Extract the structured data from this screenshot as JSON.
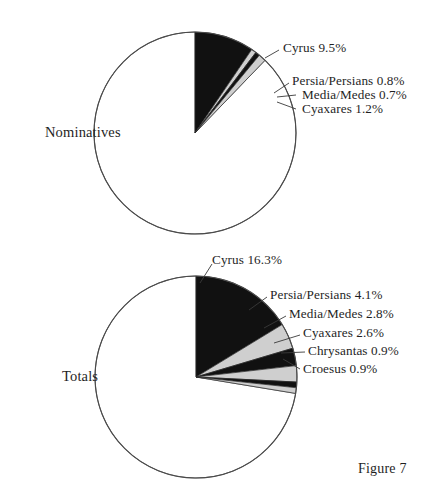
{
  "caption": "Figure 7",
  "charts": [
    {
      "id": "nominatives",
      "side_label": "Nominatives",
      "center": {
        "x": 195,
        "y": 133
      },
      "radius": 101,
      "slices": [
        {
          "name": "Cyrus",
          "value": 9.5,
          "color": "#111111",
          "label": "Cyrus 9.5%",
          "label_x": 283,
          "label_y": 40,
          "leader": [
            [
              279,
              50
            ],
            [
              265,
              58
            ]
          ]
        },
        {
          "name": "Persia/Persians",
          "value": 0.8,
          "color": "#cfcfcf",
          "label": "Persia/Persians 0.8%",
          "label_x": 292,
          "label_y": 73,
          "leader": [
            [
              289,
              83
            ],
            [
              274,
              93
            ]
          ]
        },
        {
          "name": "Media/Medes",
          "value": 0.7,
          "color": "#111111",
          "label": "Media/Medes 0.7%",
          "label_x": 302,
          "label_y": 87,
          "leader": [
            [
              296,
              95
            ],
            [
              277,
              97
            ]
          ]
        },
        {
          "name": "Cyaxares",
          "value": 1.2,
          "color": "#cfcfcf",
          "label": "Cyaxares 1.2%",
          "label_x": 302,
          "label_y": 101,
          "leader": [
            [
              296,
              109
            ],
            [
              277,
              102
            ]
          ]
        }
      ],
      "remainder": {
        "name": "Other",
        "value": 87.8,
        "color": "#ffffff"
      }
    },
    {
      "id": "totals",
      "side_label": "Totals",
      "center": {
        "x": 196,
        "y": 377
      },
      "radius": 101,
      "slices": [
        {
          "name": "Cyrus",
          "value": 16.3,
          "color": "#111111",
          "label": "Cyrus 16.3%",
          "label_x": 212,
          "label_y": 252,
          "leader": [
            [
              212,
              264
            ],
            [
              200,
              283
            ]
          ]
        },
        {
          "name": "Persia/Persians",
          "value": 4.1,
          "color": "#cfcfcf",
          "label": "Persia/Persians 4.1%",
          "label_x": 270,
          "label_y": 287,
          "leader": [
            [
              267,
              297
            ],
            [
              249,
              310
            ]
          ]
        },
        {
          "name": "Media/Medes",
          "value": 2.8,
          "color": "#111111",
          "label": "Media/Medes 2.8%",
          "label_x": 289,
          "label_y": 306,
          "leader": [
            [
              286,
              316
            ],
            [
              264,
              328
            ]
          ]
        },
        {
          "name": "Cyaxares",
          "value": 2.6,
          "color": "#cfcfcf",
          "label": "Cyaxares 2.6%",
          "label_x": 303,
          "label_y": 325,
          "leader": [
            [
              300,
              335
            ],
            [
              274,
              343
            ]
          ]
        },
        {
          "name": "Chrysantas",
          "value": 0.9,
          "color": "#111111",
          "label": "Chrysantas 0.9%",
          "label_x": 308,
          "label_y": 343,
          "leader": [
            [
              305,
              352
            ],
            [
              281,
              353
            ]
          ]
        },
        {
          "name": "Croesus",
          "value": 0.9,
          "color": "#cfcfcf",
          "label": "Croesus 0.9%",
          "label_x": 303,
          "label_y": 361,
          "leader": [
            [
              300,
              369
            ],
            [
              283,
              359
            ]
          ]
        }
      ],
      "remainder": {
        "name": "Other",
        "value": 72.4,
        "color": "#ffffff"
      }
    }
  ],
  "chart_data": {
    "type": "pie",
    "title": "Figure 7",
    "xlabel": "",
    "ylabel": "",
    "legend_position": "callout-labels",
    "grid": false,
    "charts": [
      {
        "title": "Nominatives",
        "units": "percent",
        "start_angle_deg": 0,
        "direction": "clockwise",
        "categories": [
          "Cyrus",
          "Persia/Persians",
          "Media/Medes",
          "Cyaxares",
          "Other"
        ],
        "values": [
          9.5,
          0.8,
          0.7,
          1.2,
          87.8
        ],
        "colors": [
          "#111111",
          "#cfcfcf",
          "#111111",
          "#cfcfcf",
          "#ffffff"
        ],
        "labeled": [
          true,
          true,
          true,
          true,
          false
        ]
      },
      {
        "title": "Totals",
        "units": "percent",
        "start_angle_deg": 0,
        "direction": "clockwise",
        "categories": [
          "Cyrus",
          "Persia/Persians",
          "Media/Medes",
          "Cyaxares",
          "Chrysantas",
          "Croesus",
          "Other"
        ],
        "values": [
          16.3,
          4.1,
          2.8,
          2.6,
          0.9,
          0.9,
          72.4
        ],
        "colors": [
          "#111111",
          "#cfcfcf",
          "#111111",
          "#cfcfcf",
          "#111111",
          "#cfcfcf",
          "#ffffff"
        ],
        "labeled": [
          true,
          true,
          true,
          true,
          true,
          true,
          false
        ]
      }
    ]
  }
}
